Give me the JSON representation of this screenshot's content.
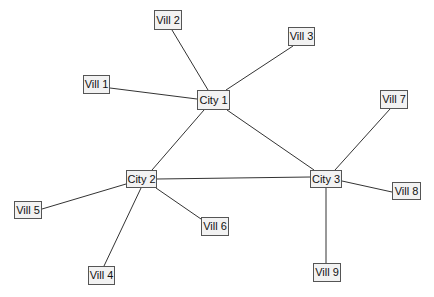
{
  "diagram": {
    "type": "network",
    "nodes": [
      {
        "id": "city1",
        "label": "City 1",
        "kind": "city",
        "x": 197,
        "y": 90,
        "w": 33,
        "h": 20
      },
      {
        "id": "city2",
        "label": "City 2",
        "kind": "city",
        "x": 126,
        "y": 170,
        "w": 31,
        "h": 18
      },
      {
        "id": "city3",
        "label": "City 3",
        "kind": "city",
        "x": 310,
        "y": 170,
        "w": 32,
        "h": 18
      },
      {
        "id": "vill1",
        "label": "Vill 1",
        "kind": "village",
        "x": 83,
        "y": 75,
        "w": 27,
        "h": 19
      },
      {
        "id": "vill2",
        "label": "Vill 2",
        "kind": "village",
        "x": 154,
        "y": 10,
        "w": 28,
        "h": 20
      },
      {
        "id": "vill3",
        "label": "Vill 3",
        "kind": "village",
        "x": 288,
        "y": 27,
        "w": 27,
        "h": 19
      },
      {
        "id": "vill4",
        "label": "Vill 4",
        "kind": "village",
        "x": 88,
        "y": 266,
        "w": 27,
        "h": 19
      },
      {
        "id": "vill5",
        "label": "Vill 5",
        "kind": "village",
        "x": 14,
        "y": 201,
        "w": 28,
        "h": 18
      },
      {
        "id": "vill6",
        "label": "Vill 6",
        "kind": "village",
        "x": 201,
        "y": 217,
        "w": 28,
        "h": 19
      },
      {
        "id": "vill7",
        "label": "Vill 7",
        "kind": "village",
        "x": 380,
        "y": 90,
        "w": 28,
        "h": 19
      },
      {
        "id": "vill8",
        "label": "Vill 8",
        "kind": "village",
        "x": 392,
        "y": 182,
        "w": 29,
        "h": 18
      },
      {
        "id": "vill9",
        "label": "Vill 9",
        "kind": "village",
        "x": 313,
        "y": 263,
        "w": 28,
        "h": 19
      }
    ],
    "edges": [
      {
        "from": "vill2",
        "to": "city1",
        "x1": 172,
        "y1": 30,
        "x2": 208,
        "y2": 90
      },
      {
        "from": "vill1",
        "to": "city1",
        "x1": 110,
        "y1": 88,
        "x2": 197,
        "y2": 99
      },
      {
        "from": "vill3",
        "to": "city1",
        "x1": 293,
        "y1": 46,
        "x2": 226,
        "y2": 90
      },
      {
        "from": "city1",
        "to": "city2",
        "x1": 204,
        "y1": 110,
        "x2": 152,
        "y2": 170
      },
      {
        "from": "city1",
        "to": "city3",
        "x1": 227,
        "y1": 110,
        "x2": 314,
        "y2": 170
      },
      {
        "from": "city2",
        "to": "city3",
        "x1": 157,
        "y1": 179,
        "x2": 310,
        "y2": 177
      },
      {
        "from": "city2",
        "to": "vill5",
        "x1": 126,
        "y1": 184,
        "x2": 42,
        "y2": 209
      },
      {
        "from": "city2",
        "to": "vill4",
        "x1": 141,
        "y1": 188,
        "x2": 104,
        "y2": 266
      },
      {
        "from": "city2",
        "to": "vill6",
        "x1": 156,
        "y1": 188,
        "x2": 201,
        "y2": 219
      },
      {
        "from": "city3",
        "to": "vill7",
        "x1": 335,
        "y1": 170,
        "x2": 390,
        "y2": 109
      },
      {
        "from": "city3",
        "to": "vill8",
        "x1": 342,
        "y1": 181,
        "x2": 392,
        "y2": 192
      },
      {
        "from": "city3",
        "to": "vill9",
        "x1": 326,
        "y1": 188,
        "x2": 326,
        "y2": 263
      }
    ]
  }
}
